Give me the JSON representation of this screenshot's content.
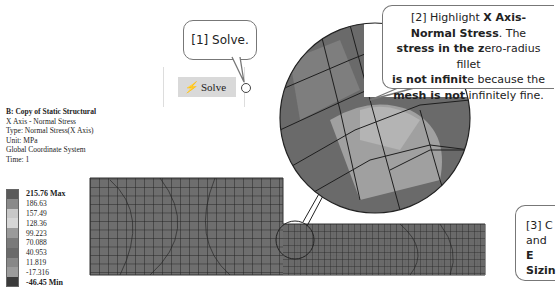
{
  "info": {
    "title": "B: Copy of Static Structural",
    "result": "X Axis - Normal Stress",
    "type": "Type: Normal Stress(X Axis)",
    "unit": "Unit: MPa",
    "coord": "Global Coordinate System",
    "time": "Time: 1"
  },
  "legend": {
    "entries": [
      {
        "label": "215.76 Max",
        "color": "#5a5a5a",
        "bold": true
      },
      {
        "label": "186.63",
        "color": "#8a8a8a"
      },
      {
        "label": "157.49",
        "color": "#c8c8c8"
      },
      {
        "label": "128.36",
        "color": "#d6d6d6"
      },
      {
        "label": "99.223",
        "color": "#9a9a9a"
      },
      {
        "label": "70.088",
        "color": "#7a7a7a"
      },
      {
        "label": "40.953",
        "color": "#6a6a6a"
      },
      {
        "label": "11.819",
        "color": "#888888"
      },
      {
        "label": "-17.316",
        "color": "#9c9c9c"
      },
      {
        "label": "-46.45 Min",
        "color": "#3a3a3a",
        "bold": true
      }
    ]
  },
  "toolbar": {
    "solve_label": "Solve",
    "solve_icon": "solve-lightning-icon"
  },
  "callouts": {
    "c1": "[1] Solve.",
    "c2": {
      "p1": "[2] Highlight ",
      "b1": "X Axis-",
      "b2": "Normal Stress",
      "p2": ". The ",
      "b3": "stress in the z",
      "p3": "ero-radius fillet",
      "b4": "is not infinit",
      "p4": "e because the",
      "b5": "mesh is not",
      "p5": " infinitely fine."
    },
    "c3": {
      "l1": "[3] C",
      "l2a": "and ",
      "l2b": "E",
      "l3": "Sizin"
    }
  },
  "colors": {
    "mesh_fill": "#6e6e6e",
    "mesh_line": "#222222",
    "callout_border": "#777777"
  }
}
